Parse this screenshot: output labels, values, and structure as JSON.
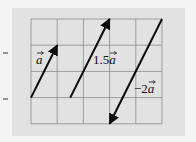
{
  "colors": {
    "background": "#f4f4f4",
    "panel": "#e2e2e2",
    "grid": "#8a8a8a",
    "arrow": "#0a0a0a"
  },
  "grid": {
    "left": 31,
    "top": 19,
    "cell": 26.2,
    "cols": 5,
    "rows": 4
  },
  "vectors": [
    {
      "name": "vector-a",
      "label": "a",
      "coef": "",
      "from": [
        0,
        3
      ],
      "to": [
        1,
        1
      ],
      "label_pos": [
        36,
        64
      ]
    },
    {
      "name": "vector-1-5a",
      "label": "a",
      "coef": "1.5",
      "from": [
        1.5,
        3
      ],
      "to": [
        3,
        0
      ],
      "label_pos": [
        93,
        64
      ]
    },
    {
      "name": "vector-neg-2a",
      "label": "a",
      "coef": "−2",
      "from": [
        5,
        0
      ],
      "to": [
        3,
        4
      ],
      "label_pos": [
        134,
        93
      ]
    }
  ],
  "ticks": [
    {
      "y": 53
    },
    {
      "y": 99
    }
  ]
}
